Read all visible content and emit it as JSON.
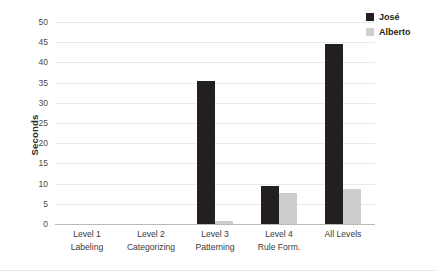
{
  "chart_data": {
    "type": "bar",
    "title": "",
    "subtitle": "",
    "xlabel": "",
    "ylabel": "Seconds",
    "ylim": [
      0,
      50
    ],
    "ytick_step": 5,
    "yticks": [
      50,
      45,
      40,
      35,
      30,
      25,
      20,
      15,
      10,
      5,
      0
    ],
    "grid": true,
    "legend_position": "top-right",
    "categories": [
      "Level 1 Labeling",
      "Level 2 Categorizing",
      "Level 3 Patterning",
      "Level 4 Rule Form.",
      "All Levels"
    ],
    "category_lines": [
      [
        "Level 1",
        "Labeling"
      ],
      [
        "Level 2",
        "Categorizing"
      ],
      [
        "Level 3",
        "Patterning"
      ],
      [
        "Level 4",
        "Rule Form."
      ],
      [
        "All Levels",
        ""
      ]
    ],
    "series": [
      {
        "name": "José",
        "color": "#231f20",
        "values": [
          0,
          0,
          35.5,
          9.5,
          44.5
        ]
      },
      {
        "name": "Alberto",
        "color": "#cdcdcd",
        "values": [
          0,
          0,
          0.8,
          7.7,
          8.7
        ]
      }
    ]
  },
  "legend": {
    "entries": [
      {
        "label": "José",
        "color": "#231f20"
      },
      {
        "label": "Alberto",
        "color": "#cdcdcd"
      }
    ]
  },
  "axis": {
    "y_title": "Seconds"
  },
  "colors": {
    "gridline": "#e9e9e9",
    "axis_line": "#b9b9b9",
    "text": "#3a3a3a",
    "jose": "#231f20",
    "alberto": "#cdcdcd"
  }
}
